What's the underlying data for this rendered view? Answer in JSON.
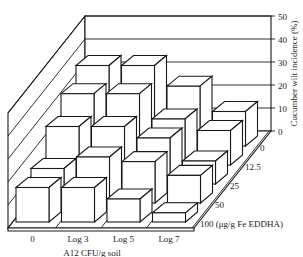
{
  "chart_data": {
    "type": "bar",
    "subtype": "3d-bar",
    "title": "",
    "xlabel": "A12 CFU/g soil",
    "ylabel": "Cucumber wilt incidence (%)",
    "zlabel": "(μg/g Fe EDDHA)",
    "categories": [
      "0",
      "Log 3",
      "Log 5",
      "Log 7"
    ],
    "depth_categories": [
      "0",
      "12.5",
      "25",
      "50",
      "100"
    ],
    "depth_tick_labels": [
      "0",
      "12.5",
      "25",
      "50",
      "100 (μg/g Fe EDDHA)"
    ],
    "y_ticks": [
      0,
      10,
      20,
      30,
      40,
      50
    ],
    "ylim": [
      0,
      50
    ],
    "grid": true,
    "series": [
      {
        "name": "0",
        "values": [
          35,
          35,
          26,
          15
        ]
      },
      {
        "name": "12.5",
        "values": [
          31,
          31,
          20,
          15
        ]
      },
      {
        "name": "25",
        "values": [
          25,
          25,
          20,
          10
        ]
      },
      {
        "name": "50",
        "values": [
          15,
          20,
          18,
          12
        ]
      },
      {
        "name": "100",
        "values": [
          15,
          15,
          10,
          4
        ]
      }
    ]
  }
}
